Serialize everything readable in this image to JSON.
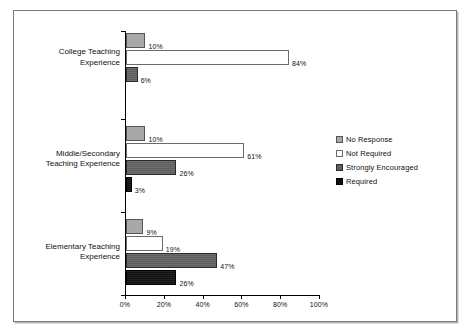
{
  "chart_data": {
    "type": "bar",
    "orientation": "horizontal",
    "title": "",
    "xlabel": "",
    "ylabel": "",
    "xlim": [
      0,
      100
    ],
    "xticks": [
      "0%",
      "20%",
      "40%",
      "60%",
      "80%",
      "100%"
    ],
    "xtick_values": [
      0,
      20,
      40,
      60,
      80,
      100
    ],
    "grid": false,
    "legend_position": "right",
    "categories": [
      "College Teaching Experience",
      "Middle/Secondary Teaching Experience",
      "Elementary Teaching Experience"
    ],
    "category_lines": [
      [
        "College Teaching",
        "Experience"
      ],
      [
        "Middle/Secondary",
        "Teaching Experience"
      ],
      [
        "Elementary Teaching",
        "Experience"
      ]
    ],
    "series": [
      {
        "name": "No Response",
        "color": "#a8a8a8",
        "values": [
          10,
          10,
          9
        ],
        "labels": [
          "10%",
          "10%",
          "9%"
        ]
      },
      {
        "name": "Not Required",
        "color": "#ffffff",
        "values": [
          84,
          61,
          19
        ],
        "labels": [
          "84%",
          "61%",
          "19%"
        ]
      },
      {
        "name": "Strongly Encouraged",
        "color": "#5e5e5e",
        "values": [
          6,
          26,
          47
        ],
        "labels": [
          "6%",
          "26%",
          "47%"
        ]
      },
      {
        "name": "Required",
        "color": "#111111",
        "values": [
          null,
          3,
          26
        ],
        "labels": [
          null,
          "3%",
          "26%"
        ]
      }
    ],
    "bars": [
      {
        "category": "College Teaching Experience",
        "series": "No Response",
        "value": 10,
        "label": "10%",
        "series_index": 0,
        "category_index": 0
      },
      {
        "category": "College Teaching Experience",
        "series": "Not Required",
        "value": 84,
        "label": "84%",
        "series_index": 1,
        "category_index": 0
      },
      {
        "category": "College Teaching Experience",
        "series": "Strongly Encouraged",
        "value": 6,
        "label": "6%",
        "series_index": 2,
        "category_index": 0
      },
      {
        "category": "Middle/Secondary Teaching Experience",
        "series": "No Response",
        "value": 10,
        "label": "10%",
        "series_index": 0,
        "category_index": 1
      },
      {
        "category": "Middle/Secondary Teaching Experience",
        "series": "Not Required",
        "value": 61,
        "label": "61%",
        "series_index": 1,
        "category_index": 1
      },
      {
        "category": "Middle/Secondary Teaching Experience",
        "series": "Strongly Encouraged",
        "value": 26,
        "label": "26%",
        "series_index": 2,
        "category_index": 1
      },
      {
        "category": "Middle/Secondary Teaching Experience",
        "series": "Required",
        "value": 3,
        "label": "3%",
        "series_index": 3,
        "category_index": 1
      },
      {
        "category": "Elementary Teaching Experience",
        "series": "No Response",
        "value": 9,
        "label": "9%",
        "series_index": 0,
        "category_index": 2
      },
      {
        "category": "Elementary Teaching Experience",
        "series": "Not Required",
        "value": 19,
        "label": "19%",
        "series_index": 1,
        "category_index": 2
      },
      {
        "category": "Elementary Teaching Experience",
        "series": "Strongly Encouraged",
        "value": 47,
        "label": "47%",
        "series_index": 2,
        "category_index": 2
      },
      {
        "category": "Elementary Teaching Experience",
        "series": "Required",
        "value": 26,
        "label": "26%",
        "series_index": 3,
        "category_index": 2
      }
    ],
    "legend": [
      "No Response",
      "Not Required",
      "Strongly Encouraged",
      "Required"
    ]
  }
}
